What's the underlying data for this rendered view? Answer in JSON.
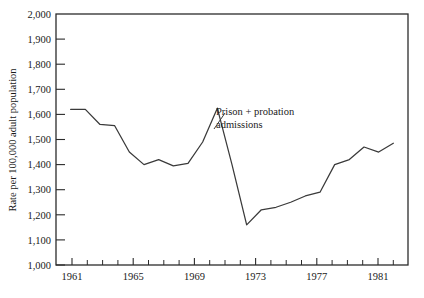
{
  "chart_data": {
    "type": "line",
    "title": "",
    "xlabel": "",
    "ylabel": "Rate per 100,000 adult population",
    "xlim": [
      1960,
      1984
    ],
    "ylim": [
      1000,
      2000
    ],
    "grid": false,
    "legend": "none",
    "annotations": [
      {
        "text_line1": "Prison + probation",
        "text_line2": "admissions",
        "points_to_x": 1971,
        "points_to_y": 1625
      }
    ],
    "y_ticks": [
      1000,
      1100,
      1200,
      1300,
      1400,
      1500,
      1600,
      1700,
      1800,
      1900,
      2000
    ],
    "y_tick_labels": [
      "1,000",
      "1,100",
      "1,200",
      "1,300",
      "1,400",
      "1,500",
      "1,600",
      "1,700",
      "1,800",
      "1,900",
      "2,000"
    ],
    "x_ticks": [
      1961,
      1962,
      1963,
      1964,
      1965,
      1966,
      1967,
      1968,
      1969,
      1970,
      1971,
      1972,
      1973,
      1974,
      1975,
      1976,
      1977,
      1978,
      1979,
      1980,
      1981,
      1982,
      1983
    ],
    "x_tick_labels_major": [
      "1961",
      "1965",
      "1969",
      "1973",
      "1977",
      "1981"
    ],
    "x_ticks_major": [
      1961,
      1965,
      1969,
      1973,
      1977,
      1981
    ],
    "series": [
      {
        "name": "Prison + probation admissions",
        "x": [
          1961,
          1962,
          1963,
          1964,
          1965,
          1966,
          1967,
          1968,
          1969,
          1970,
          1971,
          1972,
          1973,
          1974,
          1975,
          1976,
          1977,
          1978,
          1979,
          1980,
          1981,
          1982,
          1983
        ],
        "values": [
          1620,
          1620,
          1560,
          1555,
          1450,
          1400,
          1420,
          1395,
          1405,
          1490,
          1625,
          1400,
          1160,
          1220,
          1230,
          1250,
          1275,
          1290,
          1400,
          1420,
          1470,
          1450,
          1485
        ],
        "color": "#3a3a3a"
      }
    ]
  },
  "axes": {
    "y_axis_title": "Rate per 100,000 adult population"
  },
  "annotation": {
    "line1": "Prison + probation",
    "line2": "admissions"
  },
  "colors": {
    "line": "#3a3a3a",
    "frame": "#2b2b2b",
    "background": "#ffffff",
    "text": "#1a1a1a"
  }
}
